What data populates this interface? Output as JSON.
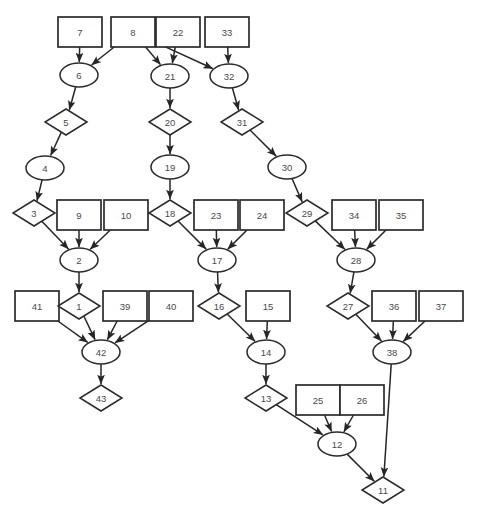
{
  "diagram": {
    "background_color": "#ffffff",
    "stroke_color": "#2b2b2b",
    "label_color": "#4a4a4a",
    "width": 477,
    "height": 520,
    "shape_legend": {
      "rect": "rectangle-node",
      "ellipse": "ellipse-node",
      "diamond": "diamond-node"
    },
    "top_partial_text": "",
    "caption": "",
    "nodes": [
      {
        "id": "7",
        "label": "7",
        "shape": "rect",
        "x": 80,
        "y": 32,
        "w": 44,
        "h": 30
      },
      {
        "id": "8",
        "label": "8",
        "shape": "rect",
        "x": 133,
        "y": 32,
        "w": 44,
        "h": 30
      },
      {
        "id": "22",
        "label": "22",
        "shape": "rect",
        "x": 178,
        "y": 32,
        "w": 44,
        "h": 30
      },
      {
        "id": "33",
        "label": "33",
        "shape": "rect",
        "x": 227,
        "y": 32,
        "w": 44,
        "h": 30
      },
      {
        "id": "6",
        "label": "6",
        "shape": "ellipse",
        "x": 79,
        "y": 75,
        "w": 38,
        "h": 24
      },
      {
        "id": "21",
        "label": "21",
        "shape": "ellipse",
        "x": 170,
        "y": 76,
        "w": 38,
        "h": 24
      },
      {
        "id": "32",
        "label": "32",
        "shape": "ellipse",
        "x": 229,
        "y": 76,
        "w": 38,
        "h": 24
      },
      {
        "id": "5",
        "label": "5",
        "shape": "diamond",
        "x": 66,
        "y": 122,
        "w": 42,
        "h": 26
      },
      {
        "id": "20",
        "label": "20",
        "shape": "diamond",
        "x": 170,
        "y": 122,
        "w": 42,
        "h": 26
      },
      {
        "id": "31",
        "label": "31",
        "shape": "diamond",
        "x": 242,
        "y": 122,
        "w": 42,
        "h": 26
      },
      {
        "id": "4",
        "label": "4",
        "shape": "ellipse",
        "x": 45,
        "y": 168,
        "w": 38,
        "h": 24
      },
      {
        "id": "19",
        "label": "19",
        "shape": "ellipse",
        "x": 170,
        "y": 167,
        "w": 38,
        "h": 24
      },
      {
        "id": "30",
        "label": "30",
        "shape": "ellipse",
        "x": 287,
        "y": 167,
        "w": 38,
        "h": 24
      },
      {
        "id": "3",
        "label": "3",
        "shape": "diamond",
        "x": 34,
        "y": 213,
        "w": 42,
        "h": 26
      },
      {
        "id": "9",
        "label": "9",
        "shape": "rect",
        "x": 79,
        "y": 215,
        "w": 44,
        "h": 30
      },
      {
        "id": "10",
        "label": "10",
        "shape": "rect",
        "x": 126,
        "y": 215,
        "w": 44,
        "h": 30
      },
      {
        "id": "18",
        "label": "18",
        "shape": "diamond",
        "x": 170,
        "y": 213,
        "w": 42,
        "h": 26
      },
      {
        "id": "23",
        "label": "23",
        "shape": "rect",
        "x": 216,
        "y": 215,
        "w": 44,
        "h": 30
      },
      {
        "id": "24",
        "label": "24",
        "shape": "rect",
        "x": 262,
        "y": 215,
        "w": 44,
        "h": 30
      },
      {
        "id": "29",
        "label": "29",
        "shape": "diamond",
        "x": 307,
        "y": 213,
        "w": 42,
        "h": 26
      },
      {
        "id": "34",
        "label": "34",
        "shape": "rect",
        "x": 354,
        "y": 215,
        "w": 44,
        "h": 30
      },
      {
        "id": "35",
        "label": "35",
        "shape": "rect",
        "x": 401,
        "y": 215,
        "w": 44,
        "h": 30
      },
      {
        "id": "2",
        "label": "2",
        "shape": "ellipse",
        "x": 79,
        "y": 260,
        "w": 38,
        "h": 24
      },
      {
        "id": "17",
        "label": "17",
        "shape": "ellipse",
        "x": 217,
        "y": 260,
        "w": 38,
        "h": 24
      },
      {
        "id": "28",
        "label": "28",
        "shape": "ellipse",
        "x": 356,
        "y": 260,
        "w": 38,
        "h": 24
      },
      {
        "id": "41",
        "label": "41",
        "shape": "rect",
        "x": 37,
        "y": 306,
        "w": 44,
        "h": 30
      },
      {
        "id": "1",
        "label": "1",
        "shape": "diamond",
        "x": 79,
        "y": 306,
        "w": 42,
        "h": 26
      },
      {
        "id": "39",
        "label": "39",
        "shape": "rect",
        "x": 125,
        "y": 306,
        "w": 44,
        "h": 30
      },
      {
        "id": "40",
        "label": "40",
        "shape": "rect",
        "x": 171,
        "y": 306,
        "w": 44,
        "h": 30
      },
      {
        "id": "16",
        "label": "16",
        "shape": "diamond",
        "x": 219,
        "y": 306,
        "w": 42,
        "h": 26
      },
      {
        "id": "15",
        "label": "15",
        "shape": "rect",
        "x": 268,
        "y": 306,
        "w": 44,
        "h": 30
      },
      {
        "id": "27",
        "label": "27",
        "shape": "diamond",
        "x": 348,
        "y": 306,
        "w": 42,
        "h": 26
      },
      {
        "id": "36",
        "label": "36",
        "shape": "rect",
        "x": 394,
        "y": 306,
        "w": 44,
        "h": 30
      },
      {
        "id": "37",
        "label": "37",
        "shape": "rect",
        "x": 441,
        "y": 306,
        "w": 44,
        "h": 30
      },
      {
        "id": "42",
        "label": "42",
        "shape": "ellipse",
        "x": 101,
        "y": 352,
        "w": 38,
        "h": 24
      },
      {
        "id": "14",
        "label": "14",
        "shape": "ellipse",
        "x": 266,
        "y": 352,
        "w": 38,
        "h": 24
      },
      {
        "id": "38",
        "label": "38",
        "shape": "ellipse",
        "x": 392,
        "y": 352,
        "w": 38,
        "h": 24
      },
      {
        "id": "43",
        "label": "43",
        "shape": "diamond",
        "x": 101,
        "y": 398,
        "w": 42,
        "h": 26
      },
      {
        "id": "13",
        "label": "13",
        "shape": "diamond",
        "x": 266,
        "y": 398,
        "w": 42,
        "h": 26
      },
      {
        "id": "25",
        "label": "25",
        "shape": "rect",
        "x": 318,
        "y": 400,
        "w": 44,
        "h": 30
      },
      {
        "id": "26",
        "label": "26",
        "shape": "rect",
        "x": 362,
        "y": 400,
        "w": 44,
        "h": 30
      },
      {
        "id": "12",
        "label": "12",
        "shape": "ellipse",
        "x": 337,
        "y": 444,
        "w": 38,
        "h": 24
      },
      {
        "id": "11",
        "label": "11",
        "shape": "diamond",
        "x": 383,
        "y": 490,
        "w": 42,
        "h": 26
      }
    ],
    "edges": [
      {
        "from": "7",
        "to": "6"
      },
      {
        "from": "8",
        "to": "6"
      },
      {
        "from": "8",
        "to": "21"
      },
      {
        "from": "22",
        "to": "21"
      },
      {
        "from": "8",
        "to": "32"
      },
      {
        "from": "33",
        "to": "32"
      },
      {
        "from": "6",
        "to": "5"
      },
      {
        "from": "21",
        "to": "20"
      },
      {
        "from": "32",
        "to": "31"
      },
      {
        "from": "5",
        "to": "4"
      },
      {
        "from": "20",
        "to": "19"
      },
      {
        "from": "31",
        "to": "30"
      },
      {
        "from": "4",
        "to": "3"
      },
      {
        "from": "19",
        "to": "18"
      },
      {
        "from": "30",
        "to": "29"
      },
      {
        "from": "3",
        "to": "2"
      },
      {
        "from": "9",
        "to": "2"
      },
      {
        "from": "10",
        "to": "2"
      },
      {
        "from": "18",
        "to": "17"
      },
      {
        "from": "23",
        "to": "17"
      },
      {
        "from": "24",
        "to": "17"
      },
      {
        "from": "29",
        "to": "28"
      },
      {
        "from": "34",
        "to": "28"
      },
      {
        "from": "35",
        "to": "28"
      },
      {
        "from": "2",
        "to": "1"
      },
      {
        "from": "17",
        "to": "16"
      },
      {
        "from": "28",
        "to": "27"
      },
      {
        "from": "41",
        "to": "42"
      },
      {
        "from": "1",
        "to": "42"
      },
      {
        "from": "39",
        "to": "42"
      },
      {
        "from": "40",
        "to": "42"
      },
      {
        "from": "16",
        "to": "14"
      },
      {
        "from": "15",
        "to": "14"
      },
      {
        "from": "27",
        "to": "38"
      },
      {
        "from": "36",
        "to": "38"
      },
      {
        "from": "37",
        "to": "38"
      },
      {
        "from": "42",
        "to": "43"
      },
      {
        "from": "14",
        "to": "13"
      },
      {
        "from": "13",
        "to": "12"
      },
      {
        "from": "25",
        "to": "12"
      },
      {
        "from": "26",
        "to": "12"
      },
      {
        "from": "12",
        "to": "11"
      },
      {
        "from": "38",
        "to": "11"
      }
    ]
  }
}
